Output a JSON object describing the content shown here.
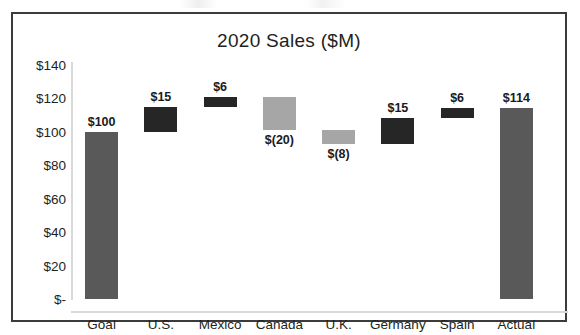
{
  "chart_data": {
    "type": "bar",
    "subtype": "waterfall",
    "title": "2020 Sales ($M)",
    "xlabel": "",
    "ylabel": "",
    "ylim": [
      0,
      140
    ],
    "grid": false,
    "legend": null,
    "y_ticks": [
      {
        "value": 140,
        "label": "$140"
      },
      {
        "value": 120,
        "label": "$120"
      },
      {
        "value": 100,
        "label": "$100"
      },
      {
        "value": 80,
        "label": "$80"
      },
      {
        "value": 60,
        "label": "$60"
      },
      {
        "value": 40,
        "label": "$40"
      },
      {
        "value": 20,
        "label": "$20"
      },
      {
        "value": 0,
        "label": "$-"
      }
    ],
    "categories": [
      "Goal",
      "U.S.",
      "Mexico",
      "Canada",
      "U.K.",
      "Germany",
      "Spain",
      "Actual"
    ],
    "values": [
      100,
      15,
      6,
      -20,
      -8,
      15,
      6,
      114
    ],
    "data_labels": [
      "$100",
      "$15",
      "$6",
      "$(20)",
      "$(8)",
      "$15",
      "$6",
      "$114"
    ],
    "bars": [
      {
        "category": "Goal",
        "label": "$100",
        "value": 100,
        "base": 0,
        "top": 100,
        "kind": "total",
        "color": "#595959",
        "label_position": "above"
      },
      {
        "category": "U.S.",
        "label": "$15",
        "value": 15,
        "base": 100,
        "top": 115,
        "kind": "increase",
        "color": "#262626",
        "label_position": "above"
      },
      {
        "category": "Mexico",
        "label": "$6",
        "value": 6,
        "base": 115,
        "top": 121,
        "kind": "increase",
        "color": "#262626",
        "label_position": "above"
      },
      {
        "category": "Canada",
        "label": "$(20)",
        "value": -20,
        "base": 121,
        "top": 101,
        "kind": "decrease",
        "color": "#a6a6a6",
        "label_position": "below"
      },
      {
        "category": "U.K.",
        "label": "$(8)",
        "value": -8,
        "base": 101,
        "top": 93,
        "kind": "decrease",
        "color": "#a6a6a6",
        "label_position": "below"
      },
      {
        "category": "Germany",
        "label": "$15",
        "value": 15,
        "base": 93,
        "top": 108,
        "kind": "increase",
        "color": "#262626",
        "label_position": "above"
      },
      {
        "category": "Spain",
        "label": "$6",
        "value": 6,
        "base": 108,
        "top": 114,
        "kind": "increase",
        "color": "#262626",
        "label_position": "above"
      },
      {
        "category": "Actual",
        "label": "$114",
        "value": 114,
        "base": 0,
        "top": 114,
        "kind": "total",
        "color": "#595959",
        "label_position": "above"
      }
    ],
    "colors": {
      "total_bar": "#595959",
      "increase_bar": "#262626",
      "decrease_bar": "#a6a6a6",
      "frame": "#3b3b3b",
      "axis_line": "#d9d9d9",
      "text": "#231f20",
      "plot_background": "#ffffff"
    }
  }
}
